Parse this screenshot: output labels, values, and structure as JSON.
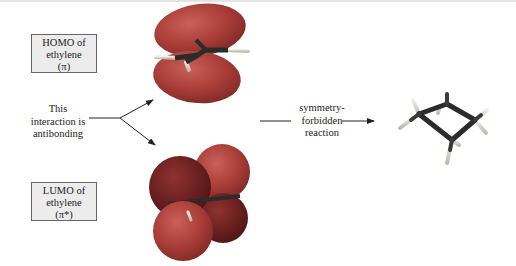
{
  "homo_label": {
    "line1": "HOMO of",
    "line2": "ethylene",
    "line3": "(π)"
  },
  "lumo_label": {
    "line1": "LUMO of",
    "line2": "ethylene",
    "line3": "(π*)"
  },
  "interaction_note": {
    "line1": "This",
    "line2": "interaction is",
    "line3": "antibonding"
  },
  "reaction_label": {
    "line1": "symmetry-",
    "line2": "forbidden",
    "line3": "reaction"
  },
  "figures": {
    "homo_orbital": "HOMO π orbital of ethylene (two lobes, same phase above/below)",
    "lumo_orbital": "LUMO π* orbital of ethylene (four lobes, alternating phase)",
    "product": "cyclobutane ball-and-stick model"
  },
  "colors": {
    "lobe_light": "#b0453f",
    "lobe_dark": "#7a2424",
    "bond": "#2b2b2b",
    "hydrogen": "#d8d8d0",
    "label_bg": "#ececec"
  }
}
